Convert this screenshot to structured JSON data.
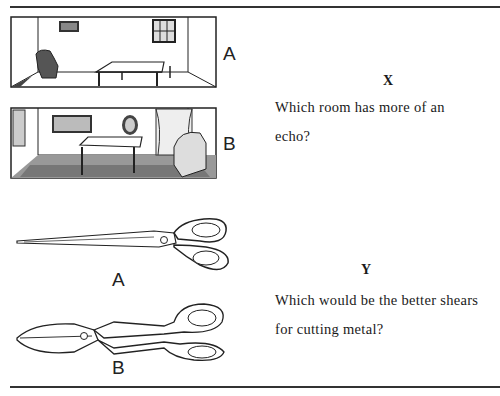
{
  "question_x": {
    "letter": "X",
    "text_line1": "Which room has more of an",
    "text_line2": "echo?",
    "options": [
      {
        "label": "A",
        "illustration": "sparse-room-icon"
      },
      {
        "label": "B",
        "illustration": "furnished-room-icon"
      }
    ]
  },
  "question_y": {
    "letter": "Y",
    "text_line1": "Which would be the better shears",
    "text_line2": "for cutting metal?",
    "options": [
      {
        "label": "A",
        "illustration": "long-scissors-icon"
      },
      {
        "label": "B",
        "illustration": "tin-snips-icon"
      }
    ]
  }
}
